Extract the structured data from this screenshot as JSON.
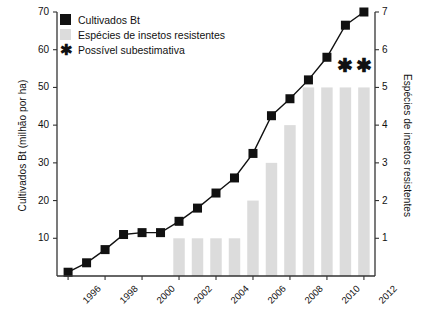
{
  "chart_data": {
    "type": "bar",
    "title": "",
    "subtitle": "",
    "xlabel": "",
    "ylabel": "Cultivados Bt (milhão por ha)",
    "ylabel_secondary": "Espécies de insetos resistentes",
    "grid": false,
    "legend_position": "top-left",
    "x": [
      1996,
      1997,
      1998,
      1999,
      2000,
      2001,
      2002,
      2003,
      2004,
      2005,
      2006,
      2007,
      2008,
      2009,
      2010,
      2011,
      2012
    ],
    "categories": [
      "1996",
      "1997",
      "1998",
      "1999",
      "2000",
      "2001",
      "2002",
      "2003",
      "2004",
      "2005",
      "2006",
      "2007",
      "2008",
      "2009",
      "2010",
      "2011",
      "2012"
    ],
    "xtick_labels": [
      "1996",
      "1998",
      "2000",
      "2002",
      "2004",
      "2006",
      "2008",
      "2010",
      "2012"
    ],
    "xtick_values": [
      1996,
      1998,
      2000,
      2002,
      2004,
      2006,
      2008,
      2010,
      2012
    ],
    "xlim": [
      1995.4,
      2012.6
    ],
    "ylim": [
      0,
      70
    ],
    "ytick_labels": [
      "10",
      "20",
      "30",
      "40",
      "50",
      "60",
      "70"
    ],
    "ytick_values": [
      10,
      20,
      30,
      40,
      50,
      60,
      70
    ],
    "ylim_secondary": [
      0,
      7
    ],
    "ytick_labels_secondary": [
      "1",
      "2",
      "3",
      "4",
      "5",
      "6",
      "7"
    ],
    "ytick_values_secondary": [
      1,
      2,
      3,
      4,
      5,
      6,
      7
    ],
    "series": [
      {
        "name": "Cultivados Bt",
        "type": "line",
        "axis": "left",
        "color": "#111111",
        "marker": "square",
        "x": [
          1996,
          1997,
          1998,
          1999,
          2000,
          2001,
          2002,
          2003,
          2004,
          2005,
          2006,
          2007,
          2008,
          2009,
          2010,
          2011,
          2012
        ],
        "values": [
          1,
          3.5,
          7,
          11,
          11.5,
          11.5,
          14.5,
          18,
          22,
          26,
          32.5,
          42.5,
          47,
          52,
          58,
          66.5,
          70
        ]
      },
      {
        "name": "Espécies de insetos resistentes",
        "type": "bar",
        "axis": "right",
        "color": "#dcdcdc",
        "x": [
          2002,
          2003,
          2004,
          2005,
          2006,
          2007,
          2008,
          2009,
          2010,
          2011,
          2012
        ],
        "values": [
          1,
          1,
          1,
          1,
          2,
          3,
          4,
          5,
          5,
          5,
          5
        ]
      }
    ],
    "annotations": [
      {
        "label": "Possível subestimativa",
        "marker": "asterisk",
        "x": 2011,
        "y_secondary": 5.35
      },
      {
        "label": "Possível subestimativa",
        "marker": "asterisk",
        "x": 2012,
        "y_secondary": 5.35
      }
    ],
    "legend": [
      {
        "label": "Cultivados Bt",
        "marker": "filled-square",
        "color": "#111111"
      },
      {
        "label": "Espécies de insetos resistentes",
        "marker": "filled-square",
        "color": "#dcdcdc"
      },
      {
        "label": "Possível subestimativa",
        "marker": "asterisk",
        "color": "#111111"
      }
    ]
  },
  "axes": {
    "left_title": "Cultivados Bt (milhão por ha)",
    "right_title": "Espécies de insetos resistentes"
  },
  "legend": {
    "items": [
      {
        "label": "Cultivados Bt"
      },
      {
        "label": "Espécies de insetos resistentes"
      },
      {
        "label": "Possível subestimativa"
      }
    ],
    "asterisk_glyph": "✱"
  }
}
